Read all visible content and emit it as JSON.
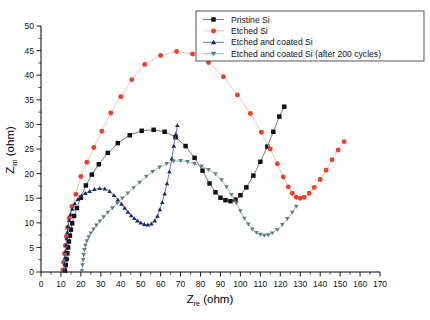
{
  "chart_data": {
    "type": "scatter",
    "title": "",
    "xlabel": "Z_re (ohm)",
    "xlabel_main": "Z",
    "xlabel_sub": "re",
    "xlabel_unit": " (ohm)",
    "ylabel": "Z_im (ohm)",
    "ylabel_main": "Z",
    "ylabel_sub": "im",
    "ylabel_unit": " (ohm)",
    "xlim": [
      0,
      170
    ],
    "ylim": [
      0,
      50
    ],
    "xticks": [
      0,
      10,
      20,
      30,
      40,
      50,
      60,
      70,
      80,
      90,
      100,
      110,
      120,
      130,
      140,
      150,
      160,
      170
    ],
    "yticks": [
      0,
      5,
      10,
      15,
      20,
      25,
      30,
      35,
      40,
      45,
      50
    ],
    "grid": false,
    "minor_ticks": true,
    "legend_position": "top-right",
    "series": [
      {
        "name": "Pristine Si",
        "color": "#111111",
        "marker": "square",
        "line_color": "#6b6b6b",
        "points": [
          [
            12.0,
            0.3
          ],
          [
            12.4,
            1.4
          ],
          [
            12.8,
            2.6
          ],
          [
            13.2,
            3.8
          ],
          [
            13.6,
            5.0
          ],
          [
            14.0,
            6.2
          ],
          [
            14.5,
            7.4
          ],
          [
            15.0,
            8.6
          ],
          [
            15.6,
            9.9
          ],
          [
            16.6,
            11.4
          ],
          [
            18.0,
            13.0
          ],
          [
            20.0,
            15.1
          ],
          [
            22.5,
            17.6
          ],
          [
            25.5,
            19.8
          ],
          [
            29.0,
            21.9
          ],
          [
            33.5,
            24.2
          ],
          [
            38.5,
            26.2
          ],
          [
            44.5,
            27.8
          ],
          [
            50.5,
            28.7
          ],
          [
            56.5,
            28.9
          ],
          [
            62.0,
            28.5
          ],
          [
            67.5,
            27.4
          ],
          [
            72.5,
            25.6
          ],
          [
            77.0,
            23.2
          ],
          [
            81.0,
            20.6
          ],
          [
            84.5,
            18.0
          ],
          [
            87.5,
            16.2
          ],
          [
            90.0,
            15.1
          ],
          [
            92.5,
            14.6
          ],
          [
            95.0,
            14.4
          ],
          [
            97.5,
            14.7
          ],
          [
            100.0,
            15.6
          ],
          [
            103.0,
            17.2
          ],
          [
            106.5,
            19.6
          ],
          [
            110.0,
            22.4
          ],
          [
            113.5,
            25.5
          ],
          [
            116.5,
            28.5
          ],
          [
            119.5,
            31.6
          ],
          [
            122.0,
            33.6
          ]
        ]
      },
      {
        "name": "Etched Si",
        "color": "#E8432A",
        "marker": "circle",
        "line_color": "#f7b8ab",
        "points": [
          [
            11.0,
            0.4
          ],
          [
            11.4,
            2.0
          ],
          [
            11.8,
            3.7
          ],
          [
            12.2,
            5.4
          ],
          [
            12.7,
            7.2
          ],
          [
            13.3,
            9.0
          ],
          [
            14.2,
            11.0
          ],
          [
            15.5,
            13.3
          ],
          [
            17.5,
            15.8
          ],
          [
            20.0,
            19.4
          ],
          [
            23.0,
            22.3
          ],
          [
            26.5,
            25.3
          ],
          [
            30.5,
            28.6
          ],
          [
            35.0,
            32.3
          ],
          [
            40.0,
            35.6
          ],
          [
            45.5,
            39.1
          ],
          [
            52.0,
            42.2
          ],
          [
            60.0,
            44.0
          ],
          [
            68.0,
            44.8
          ],
          [
            76.0,
            44.3
          ],
          [
            84.0,
            42.6
          ],
          [
            91.5,
            39.7
          ],
          [
            98.5,
            36.0
          ],
          [
            105.0,
            32.2
          ],
          [
            110.5,
            28.4
          ],
          [
            115.0,
            25.0
          ],
          [
            118.5,
            22.0
          ],
          [
            121.5,
            19.3
          ],
          [
            124.0,
            17.3
          ],
          [
            126.0,
            16.0
          ],
          [
            128.0,
            15.2
          ],
          [
            130.0,
            15.0
          ],
          [
            132.0,
            15.2
          ],
          [
            134.5,
            16.0
          ],
          [
            137.0,
            17.2
          ],
          [
            140.0,
            18.8
          ],
          [
            143.0,
            20.7
          ],
          [
            146.0,
            22.8
          ],
          [
            149.0,
            24.8
          ],
          [
            152.0,
            26.5
          ]
        ]
      },
      {
        "name": "Etched and coated Si",
        "color": "#1B2A63",
        "marker": "triangle-up",
        "line_color": "#5a6aa8",
        "points": [
          [
            11.5,
            0.3
          ],
          [
            11.8,
            1.6
          ],
          [
            12.0,
            2.9
          ],
          [
            12.3,
            4.2
          ],
          [
            12.6,
            5.5
          ],
          [
            12.9,
            6.8
          ],
          [
            13.2,
            8.1
          ],
          [
            13.6,
            9.3
          ],
          [
            14.1,
            10.5
          ],
          [
            14.8,
            11.7
          ],
          [
            15.7,
            12.8
          ],
          [
            16.9,
            13.9
          ],
          [
            18.4,
            14.8
          ],
          [
            20.2,
            15.5
          ],
          [
            22.2,
            16.0
          ],
          [
            24.4,
            16.4
          ],
          [
            26.8,
            16.8
          ],
          [
            29.4,
            17.0
          ],
          [
            32.0,
            16.9
          ],
          [
            34.4,
            16.4
          ],
          [
            36.6,
            15.6
          ],
          [
            38.6,
            14.7
          ],
          [
            40.4,
            13.8
          ],
          [
            42.0,
            13.0
          ],
          [
            43.6,
            12.2
          ],
          [
            45.2,
            11.5
          ],
          [
            46.8,
            10.9
          ],
          [
            48.4,
            10.4
          ],
          [
            50.0,
            10.0
          ],
          [
            51.8,
            9.7
          ],
          [
            53.6,
            9.6
          ],
          [
            55.4,
            9.8
          ],
          [
            57.0,
            10.4
          ],
          [
            58.4,
            11.4
          ],
          [
            59.6,
            12.7
          ],
          [
            60.8,
            14.2
          ],
          [
            62.0,
            15.9
          ],
          [
            63.2,
            18.0
          ],
          [
            64.4,
            20.4
          ],
          [
            65.6,
            23.0
          ],
          [
            66.6,
            25.6
          ],
          [
            67.6,
            28.0
          ],
          [
            68.4,
            29.8
          ]
        ]
      },
      {
        "name": "Etched and coated Si (after 200 cycles)",
        "color": "#5A7F7F",
        "marker": "triangle-down",
        "line_color": "#93b2b2",
        "points": [
          [
            20.5,
            0.2
          ],
          [
            20.8,
            1.4
          ],
          [
            21.1,
            2.5
          ],
          [
            21.4,
            3.5
          ],
          [
            21.8,
            4.5
          ],
          [
            22.3,
            5.4
          ],
          [
            23.0,
            6.3
          ],
          [
            23.9,
            7.1
          ],
          [
            25.0,
            7.9
          ],
          [
            26.3,
            8.7
          ],
          [
            27.8,
            9.5
          ],
          [
            29.5,
            10.3
          ],
          [
            31.4,
            11.2
          ],
          [
            33.5,
            12.1
          ],
          [
            35.8,
            13.0
          ],
          [
            38.2,
            14.0
          ],
          [
            40.8,
            15.0
          ],
          [
            43.5,
            16.0
          ],
          [
            46.4,
            17.1
          ],
          [
            49.5,
            18.2
          ],
          [
            52.8,
            19.4
          ],
          [
            56.0,
            20.4
          ],
          [
            59.5,
            21.3
          ],
          [
            63.0,
            22.0
          ],
          [
            66.5,
            22.5
          ],
          [
            70.0,
            22.6
          ],
          [
            73.5,
            22.4
          ],
          [
            77.0,
            22.0
          ],
          [
            80.5,
            21.5
          ],
          [
            84.0,
            20.8
          ],
          [
            87.5,
            19.9
          ],
          [
            90.5,
            18.7
          ],
          [
            93.0,
            17.3
          ],
          [
            95.5,
            15.7
          ],
          [
            98.0,
            14.0
          ],
          [
            100.0,
            12.4
          ],
          [
            102.0,
            10.9
          ],
          [
            104.0,
            9.7
          ],
          [
            106.0,
            8.7
          ],
          [
            108.0,
            8.0
          ],
          [
            110.0,
            7.6
          ],
          [
            112.0,
            7.4
          ],
          [
            114.0,
            7.5
          ],
          [
            116.0,
            7.9
          ],
          [
            118.5,
            8.6
          ],
          [
            121.0,
            9.6
          ],
          [
            123.5,
            10.8
          ],
          [
            126.0,
            12.1
          ],
          [
            128.0,
            13.3
          ]
        ]
      }
    ]
  },
  "legend": {
    "items": [
      {
        "label": "Pristine Si",
        "color": "#111111",
        "marker": "square"
      },
      {
        "label": "Etched Si",
        "color": "#E8432A",
        "marker": "circle"
      },
      {
        "label": "Etched and coated Si",
        "color": "#1B2A63",
        "marker": "triangle-up"
      },
      {
        "label": "Etched and coated Si (after 200 cycles)",
        "color": "#5A7F7F",
        "marker": "triangle-down"
      }
    ]
  }
}
